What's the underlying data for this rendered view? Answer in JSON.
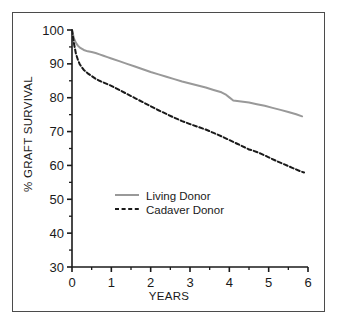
{
  "figure": {
    "border_color": "#4b4b4b",
    "background": "#ffffff"
  },
  "chart_data": {
    "type": "line",
    "title": "",
    "xlabel": "YEARS",
    "ylabel": "% GRAFT SURVIVAL",
    "xlim": [
      0,
      6
    ],
    "ylim": [
      30,
      100
    ],
    "xticks": [
      0,
      1,
      2,
      3,
      4,
      5,
      6
    ],
    "xtick_labels": [
      "0",
      "1",
      "2",
      "3",
      "4",
      "5",
      "6"
    ],
    "xminor_ticks": [
      0.5,
      1.5,
      2.5,
      3.5,
      4.5,
      5.5
    ],
    "yticks": [
      30,
      40,
      50,
      60,
      70,
      80,
      90,
      100
    ],
    "ytick_labels": [
      "30",
      "40",
      "50",
      "60",
      "70",
      "80",
      "90",
      "100"
    ],
    "yminor_ticks": [
      35,
      45,
      55,
      65,
      75,
      85,
      95
    ],
    "grid": false,
    "legend_position": "center-left",
    "series": [
      {
        "name": "Living Donor",
        "color": "#999999",
        "style": "solid",
        "width": 2.0,
        "x": [
          0,
          0.05,
          0.1,
          0.15,
          0.2,
          0.3,
          0.4,
          0.5,
          0.6,
          0.7,
          0.8,
          0.9,
          1.0,
          1.2,
          1.4,
          1.6,
          1.8,
          2.0,
          2.2,
          2.4,
          2.6,
          2.8,
          3.0,
          3.2,
          3.4,
          3.6,
          3.8,
          3.9,
          4.0,
          4.1,
          4.3,
          4.5,
          4.7,
          4.9,
          5.1,
          5.3,
          5.5,
          5.7,
          5.85
        ],
        "y": [
          100,
          97.5,
          96.2,
          95.4,
          94.8,
          94.1,
          93.7,
          93.5,
          93.2,
          92.8,
          92.4,
          92.0,
          91.6,
          90.8,
          90.0,
          89.2,
          88.4,
          87.6,
          86.9,
          86.2,
          85.5,
          84.8,
          84.2,
          83.6,
          83.0,
          82.3,
          81.6,
          81.0,
          80.1,
          79.2,
          78.9,
          78.6,
          78.1,
          77.6,
          77.0,
          76.4,
          75.8,
          75.1,
          74.5
        ]
      },
      {
        "name": "Cadaver Donor",
        "color": "#1a1a1a",
        "style": "dashed",
        "width": 2.0,
        "x": [
          0,
          0.05,
          0.1,
          0.15,
          0.2,
          0.3,
          0.4,
          0.5,
          0.6,
          0.7,
          0.8,
          0.9,
          1.0,
          1.2,
          1.4,
          1.6,
          1.8,
          2.0,
          2.2,
          2.4,
          2.6,
          2.8,
          3.0,
          3.2,
          3.4,
          3.6,
          3.8,
          4.0,
          4.2,
          4.4,
          4.5,
          4.6,
          4.8,
          5.0,
          5.2,
          5.4,
          5.6,
          5.8,
          5.9
        ],
        "y": [
          100,
          96.0,
          93.0,
          91.2,
          89.8,
          88.2,
          87.2,
          86.4,
          85.6,
          85.0,
          84.5,
          84.0,
          83.5,
          82.3,
          81.1,
          79.9,
          78.7,
          77.5,
          76.3,
          75.2,
          74.1,
          73.1,
          72.2,
          71.4,
          70.6,
          69.6,
          68.6,
          67.5,
          66.4,
          65.3,
          64.7,
          64.4,
          63.5,
          62.4,
          61.3,
          60.3,
          59.3,
          58.3,
          57.9
        ]
      }
    ]
  },
  "legend": {
    "items": [
      {
        "label": "Living Donor",
        "color": "#999999",
        "style": "solid"
      },
      {
        "label": "Cadaver Donor",
        "color": "#1a1a1a",
        "style": "dashed"
      }
    ]
  }
}
